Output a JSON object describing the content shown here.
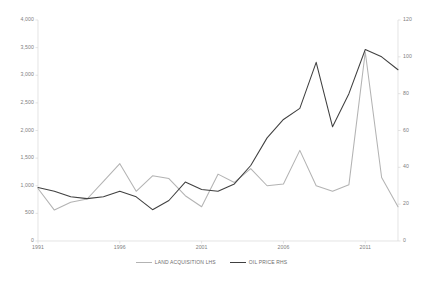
{
  "chart_data": {
    "type": "line",
    "title": "",
    "subtitle": "",
    "xlabel": "",
    "ylabel": "",
    "grid": false,
    "legend_position": "bottom",
    "x": [
      1991,
      1992,
      1993,
      1994,
      1995,
      1996,
      1997,
      1998,
      1999,
      2000,
      2001,
      2002,
      2003,
      2004,
      2005,
      2006,
      2007,
      2008,
      2009,
      2010,
      2011,
      2012,
      2013
    ],
    "x_tick_labels": [
      "1991",
      "1996",
      "2001",
      "2006",
      "2011"
    ],
    "x_tick_values": [
      1991,
      1996,
      2001,
      2006,
      2011
    ],
    "axes": {
      "left": {
        "label": "LAND ACQUISITION",
        "ylim": [
          0,
          4000
        ],
        "ticks": [
          0,
          500,
          1000,
          1500,
          2000,
          2500,
          3000,
          3500,
          4000
        ],
        "tick_labels": [
          "0",
          "500",
          "1,000",
          "1,500",
          "2,000",
          "2,500",
          "3,000",
          "3,500",
          "4,000"
        ]
      },
      "right": {
        "label": "OIL PRICE",
        "ylim": [
          0,
          120
        ],
        "ticks": [
          0,
          20,
          40,
          60,
          80,
          100,
          120
        ],
        "tick_labels": [
          "0",
          "20",
          "40",
          "60",
          "80",
          "100",
          "120"
        ]
      }
    },
    "series": [
      {
        "name": "LAND ACQUISITION LHS",
        "axis": "left",
        "color": "#b3b3b3",
        "values": [
          950,
          560,
          700,
          760,
          1080,
          1400,
          900,
          1180,
          1130,
          820,
          620,
          1210,
          1060,
          1310,
          1000,
          1030,
          1640,
          1000,
          900,
          1020,
          3420,
          1150,
          620
        ]
      },
      {
        "name": "OIL PRICE RHS",
        "axis": "right",
        "color": "#404040",
        "values": [
          29,
          27,
          24,
          23,
          24,
          27,
          24,
          17,
          22,
          32,
          28,
          27,
          31,
          41,
          56,
          66,
          72,
          97,
          62,
          80,
          104,
          100,
          93
        ]
      }
    ]
  },
  "legend": {
    "items": [
      {
        "label": "LAND ACQUISITION LHS",
        "color": "#b3b3b3"
      },
      {
        "label": "OIL PRICE RHS",
        "color": "#404040"
      }
    ]
  }
}
